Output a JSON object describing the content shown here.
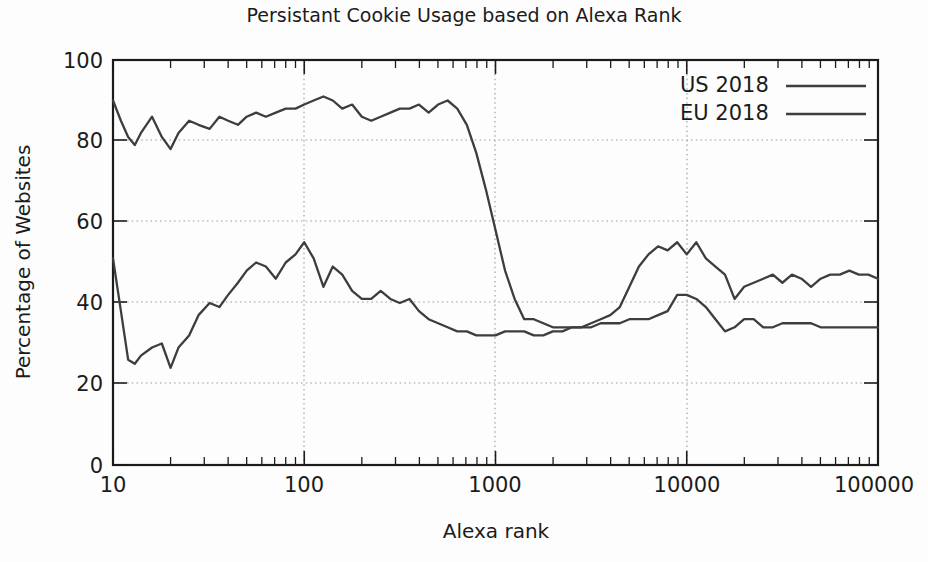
{
  "chart_data": {
    "type": "line",
    "title": "Persistant Cookie Usage based on Alexa Rank",
    "xlabel": "Alexa rank",
    "ylabel": "Percentage of Websites",
    "xscale": "log",
    "yscale": "linear",
    "xlim": [
      10,
      100000
    ],
    "ylim": [
      0,
      100
    ],
    "xticks": [
      10,
      100,
      1000,
      10000,
      100000
    ],
    "xtick_labels": [
      "10",
      "100",
      "1000",
      "10000",
      "100000"
    ],
    "yticks": [
      0,
      20,
      40,
      60,
      80,
      100
    ],
    "ytick_labels": [
      "0",
      "20",
      "40",
      "60",
      "80",
      "100"
    ],
    "grid": true,
    "grid_style": "dotted",
    "legend_position": "top-right",
    "line_color": "#3d3d3d",
    "background_color": "#fdfdfd",
    "series": [
      {
        "name": "US 2018",
        "color": "#3d3d3d",
        "x": [
          10,
          11,
          12,
          13,
          14,
          16,
          18,
          20,
          22,
          25,
          28,
          32,
          36,
          40,
          45,
          50,
          56,
          63,
          71,
          80,
          90,
          100,
          112,
          126,
          141,
          158,
          178,
          200,
          224,
          251,
          282,
          316,
          355,
          398,
          447,
          501,
          562,
          631,
          708,
          794,
          891,
          1000,
          1122,
          1259,
          1413,
          1585,
          1778,
          1995,
          2239,
          2512,
          2818,
          3162,
          3548,
          3981,
          4467,
          5012,
          5623,
          6310,
          7079,
          7943,
          8913,
          10000,
          11220,
          12589,
          14125,
          15849,
          17783,
          19953,
          22387,
          25119,
          28184,
          31623,
          35481,
          39811,
          44668,
          50119,
          56234,
          63096,
          70795,
          79433,
          89125,
          100000
        ],
        "y": [
          90,
          85,
          81,
          79,
          82,
          86,
          81,
          78,
          82,
          85,
          84,
          83,
          86,
          85,
          84,
          86,
          87,
          86,
          87,
          88,
          88,
          89,
          90,
          91,
          90,
          88,
          89,
          86,
          85,
          86,
          87,
          88,
          88,
          89,
          87,
          89,
          90,
          88,
          84,
          77,
          68,
          58,
          48,
          41,
          36,
          36,
          35,
          34,
          34,
          34,
          34,
          35,
          36,
          37,
          39,
          44,
          49,
          52,
          54,
          53,
          55,
          52,
          55,
          51,
          49,
          47,
          41,
          44,
          45,
          46,
          47,
          45,
          47,
          46,
          44,
          46,
          47,
          47,
          48,
          47,
          47,
          46
        ],
        "endpoint_note": "starts near 90% at rank 10, plateaus ~85-90% to rank ~600, sharp fall to ~35% by rank ~1200, rises again to ~55% near rank 8000-10000, settles near 46-47%"
      },
      {
        "name": "EU 2018",
        "color": "#3d3d3d",
        "x": [
          10,
          11,
          12,
          13,
          14,
          16,
          18,
          20,
          22,
          25,
          28,
          32,
          36,
          40,
          45,
          50,
          56,
          63,
          71,
          80,
          90,
          100,
          112,
          126,
          141,
          158,
          178,
          200,
          224,
          251,
          282,
          316,
          355,
          398,
          447,
          501,
          562,
          631,
          708,
          794,
          891,
          1000,
          1122,
          1259,
          1413,
          1585,
          1778,
          1995,
          2239,
          2512,
          2818,
          3162,
          3548,
          3981,
          4467,
          5012,
          5623,
          6310,
          7079,
          7943,
          8913,
          10000,
          11220,
          12589,
          14125,
          15849,
          17783,
          19953,
          22387,
          25119,
          28184,
          31623,
          35481,
          39811,
          44668,
          50119,
          56234,
          63096,
          70795,
          79433,
          89125,
          100000
        ],
        "y": [
          51,
          38,
          26,
          25,
          27,
          29,
          30,
          24,
          29,
          32,
          37,
          40,
          39,
          42,
          45,
          48,
          50,
          49,
          46,
          50,
          52,
          55,
          51,
          44,
          49,
          47,
          43,
          41,
          41,
          43,
          41,
          40,
          41,
          38,
          36,
          35,
          34,
          33,
          33,
          32,
          32,
          32,
          33,
          33,
          33,
          32,
          32,
          33,
          33,
          34,
          34,
          34,
          35,
          35,
          35,
          36,
          36,
          36,
          37,
          38,
          42,
          42,
          41,
          39,
          36,
          33,
          34,
          36,
          36,
          34,
          34,
          35,
          35,
          35,
          35,
          34,
          34,
          34,
          34,
          34,
          34,
          34
        ],
        "endpoint_note": "starts ~51% at rank 10, dips to ~24% near rank 20, rises to peak ~55% near rank 100, declines to ~32% plateau from rank 800-5000, small bump to ~42% near rank 9000-10000, flat ~34% to rank 100000"
      }
    ]
  },
  "legend": {
    "entries": [
      {
        "label": "US 2018"
      },
      {
        "label": "EU 2018"
      }
    ]
  }
}
